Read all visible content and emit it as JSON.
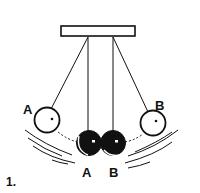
{
  "figure": {
    "number": "1."
  },
  "labels": {
    "ball_a_raised": "A",
    "ball_b_raised": "B",
    "ball_a_lowest": "A",
    "ball_b_lowest": "B"
  },
  "colors": {
    "line": "#111111",
    "ball_raised_fill": "#ffffff",
    "ball_lowest_fill": "#111111",
    "background": "#ffffff"
  },
  "icons": {
    "support_bar": "rectangle",
    "raised_ball": "hollow-circle",
    "lowest_ball": "filled-circle"
  }
}
